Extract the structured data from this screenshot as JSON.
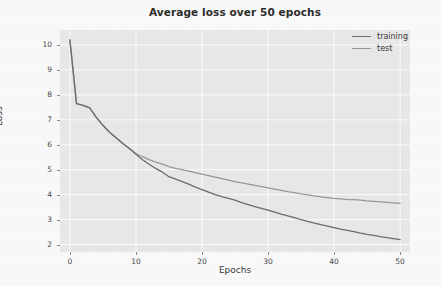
{
  "chart_data": {
    "type": "line",
    "title": "Average loss over 50 epochs",
    "xlabel": "Epochs",
    "ylabel": "Loss",
    "xlim": [
      -1.5,
      51.5
    ],
    "ylim": [
      1.7,
      10.6
    ],
    "xticks": [
      "0",
      "10",
      "20",
      "30",
      "40",
      "50"
    ],
    "xtick_values": [
      0,
      10,
      20,
      30,
      40,
      50
    ],
    "yticks": [
      "2",
      "3",
      "4",
      "5",
      "6",
      "7",
      "8",
      "9",
      "10"
    ],
    "ytick_values": [
      2,
      3,
      4,
      5,
      6,
      7,
      8,
      9,
      10
    ],
    "grid": true,
    "grid_color": "#ffffff",
    "plot_background": "#ebebeb",
    "legend_position": "upper right",
    "x": [
      0,
      1,
      2,
      3,
      4,
      5,
      6,
      7,
      8,
      9,
      10,
      11,
      12,
      13,
      14,
      15,
      16,
      17,
      18,
      19,
      20,
      21,
      22,
      23,
      24,
      25,
      26,
      27,
      28,
      29,
      30,
      31,
      32,
      33,
      34,
      35,
      36,
      37,
      38,
      39,
      40,
      41,
      42,
      43,
      44,
      45,
      46,
      47,
      48,
      49,
      50
    ],
    "series": [
      {
        "name": "training",
        "color": "#6e6e6e",
        "values": [
          10.2,
          7.65,
          7.58,
          7.48,
          7.1,
          6.78,
          6.5,
          6.28,
          6.05,
          5.85,
          5.62,
          5.4,
          5.22,
          5.05,
          4.9,
          4.72,
          4.62,
          4.52,
          4.42,
          4.3,
          4.2,
          4.1,
          4.0,
          3.92,
          3.85,
          3.78,
          3.68,
          3.6,
          3.52,
          3.45,
          3.38,
          3.3,
          3.22,
          3.15,
          3.08,
          3.0,
          2.93,
          2.86,
          2.8,
          2.74,
          2.68,
          2.62,
          2.57,
          2.52,
          2.46,
          2.41,
          2.37,
          2.32,
          2.28,
          2.24,
          2.2
        ]
      },
      {
        "name": "test",
        "color": "#9a9a9a",
        "values": [
          10.2,
          7.65,
          7.58,
          7.48,
          7.1,
          6.78,
          6.5,
          6.28,
          6.05,
          5.85,
          5.65,
          5.52,
          5.4,
          5.3,
          5.22,
          5.12,
          5.05,
          5.0,
          4.94,
          4.88,
          4.82,
          4.76,
          4.7,
          4.64,
          4.58,
          4.52,
          4.47,
          4.42,
          4.37,
          4.32,
          4.27,
          4.22,
          4.17,
          4.12,
          4.08,
          4.03,
          3.99,
          3.95,
          3.91,
          3.88,
          3.85,
          3.83,
          3.8,
          3.8,
          3.78,
          3.75,
          3.73,
          3.71,
          3.69,
          3.67,
          3.65
        ]
      }
    ]
  },
  "legend": {
    "items": [
      {
        "label": "training"
      },
      {
        "label": "test"
      }
    ]
  }
}
